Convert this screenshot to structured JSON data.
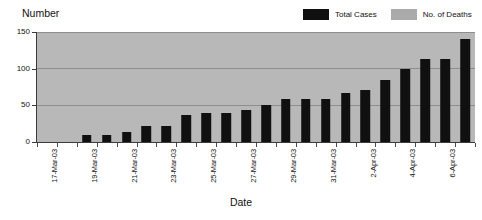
{
  "chart_data": {
    "type": "bar",
    "title": "",
    "xlabel": "Date",
    "ylabel": "Number",
    "ylim": [
      0,
      150
    ],
    "yticks": [
      0,
      50,
      100,
      150
    ],
    "ytick_labels": [
      "0",
      "50",
      "100",
      "150"
    ],
    "grid": true,
    "legend_position": "top-right",
    "categories": [
      "17-Mar-03",
      "18-Mar-03",
      "19-Mar-03",
      "20-Mar-03",
      "21-Mar-03",
      "22-Mar-03",
      "23-Mar-03",
      "24-Mar-03",
      "25-Mar-03",
      "26-Mar-03",
      "27-Mar-03",
      "28-Mar-03",
      "29-Mar-03",
      "30-Mar-03",
      "31-Mar-03",
      "1-Apr-03",
      "2-Apr-03",
      "3-Apr-03",
      "4-Apr-03",
      "5-Apr-03",
      "6-Apr-03",
      "7-Apr-03"
    ],
    "visible_tick_labels": [
      "17-Mar-03",
      "19-Mar-03",
      "21-Mar-03",
      "23-Mar-03",
      "25-Mar-03",
      "27-Mar-03",
      "29-Mar-03",
      "31-Mar-03",
      "2-Apr-03",
      "4-Apr-03",
      "6-Apr-03"
    ],
    "series": [
      {
        "name": "Total Cases",
        "color": "#101010",
        "values": [
          0,
          0,
          9,
          9,
          13,
          22,
          22,
          37,
          39,
          39,
          44,
          51,
          59,
          59,
          59,
          67,
          71,
          84,
          100,
          113,
          113,
          141
        ]
      },
      {
        "name": "No. of Deaths",
        "color": "#aaaaaa",
        "values": [
          0,
          0,
          0,
          0,
          0,
          0,
          0,
          0,
          0,
          0,
          0,
          0,
          0,
          0,
          0,
          0,
          0,
          0,
          0,
          0,
          0,
          0
        ]
      }
    ]
  },
  "legend": {
    "entries": [
      {
        "label": "Total Cases",
        "color": "#101010"
      },
      {
        "label": "No. of Deaths",
        "color": "#aaaaaa"
      }
    ]
  },
  "axes": {
    "y_title": "Number",
    "x_title": "Date"
  },
  "colors": {
    "plot_background": "#b8b8b8",
    "gridline": "#8e8e8e",
    "axis": "#3c3c3c",
    "bar_total_cases": "#101010",
    "bar_deaths": "#aaaaaa",
    "page_background": "#ffffff"
  }
}
